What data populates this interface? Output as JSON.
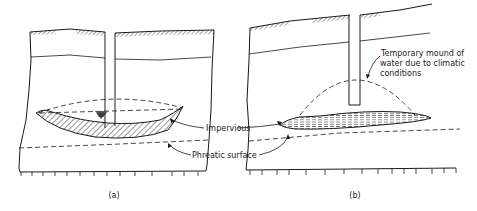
{
  "figure": {
    "panels": [
      {
        "id": "a",
        "caption": "(a)"
      },
      {
        "id": "b",
        "caption": "(b)"
      }
    ],
    "labels": {
      "impervious": "Impervious",
      "phreatic_surface": "Phreatic surface",
      "mound_line1": "Temporary mound of",
      "mound_line2": "water due to climatic",
      "mound_line3": "conditions"
    },
    "colors": {
      "ink": "#1a1a1a",
      "background": "#ffffff"
    }
  }
}
